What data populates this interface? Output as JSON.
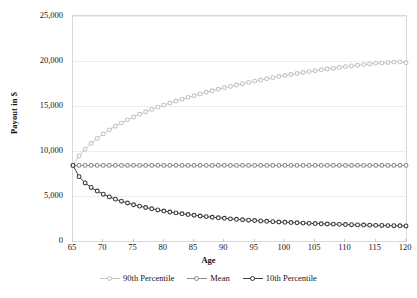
{
  "chart_data": {
    "type": "line",
    "title": "",
    "xlabel": "Age",
    "ylabel": "Payout in $",
    "xlim": [
      65,
      120
    ],
    "ylim": [
      0,
      25000
    ],
    "grid": true,
    "legend_position": "bottom",
    "x_tick_labels": [
      "65",
      "70",
      "75",
      "80",
      "85",
      "90",
      "95",
      "100",
      "105",
      "110",
      "115",
      "120"
    ],
    "x_ticks": [
      65,
      70,
      75,
      80,
      85,
      90,
      95,
      100,
      105,
      110,
      115,
      120
    ],
    "y_tick_labels": [
      "0",
      "5,000",
      "10,000",
      "15,000",
      "20,000",
      "25,000"
    ],
    "y_ticks": [
      0,
      5000,
      10000,
      15000,
      20000,
      25000
    ],
    "x": [
      65,
      66,
      67,
      68,
      69,
      70,
      71,
      72,
      73,
      74,
      75,
      76,
      77,
      78,
      79,
      80,
      81,
      82,
      83,
      84,
      85,
      86,
      87,
      88,
      89,
      90,
      91,
      92,
      93,
      94,
      95,
      96,
      97,
      98,
      99,
      100,
      101,
      102,
      103,
      104,
      105,
      106,
      107,
      108,
      109,
      110,
      111,
      112,
      113,
      114,
      115,
      116,
      117,
      118,
      119,
      120
    ],
    "series": [
      {
        "name": "90th Percentile",
        "color": "#c4c4c4",
        "marker": "circle",
        "values": [
          8400,
          9450,
          10200,
          10850,
          11400,
          11900,
          12350,
          12750,
          13120,
          13460,
          13780,
          14080,
          14360,
          14620,
          14870,
          15100,
          15330,
          15550,
          15760,
          15960,
          16150,
          16340,
          16520,
          16690,
          16860,
          17020,
          17180,
          17330,
          17480,
          17620,
          17760,
          17890,
          18020,
          18150,
          18270,
          18390,
          18500,
          18610,
          18720,
          18820,
          18920,
          19020,
          19110,
          19200,
          19290,
          19370,
          19450,
          19530,
          19600,
          19670,
          19740,
          19790,
          19840,
          19880,
          19900,
          19800
        ]
      },
      {
        "name": "Mean",
        "color": "#8a8a8a",
        "marker": "circle",
        "values": [
          8400,
          8400,
          8400,
          8400,
          8400,
          8400,
          8400,
          8400,
          8400,
          8400,
          8400,
          8400,
          8400,
          8400,
          8400,
          8400,
          8400,
          8400,
          8400,
          8400,
          8400,
          8400,
          8400,
          8400,
          8400,
          8400,
          8400,
          8400,
          8400,
          8400,
          8400,
          8400,
          8400,
          8400,
          8400,
          8400,
          8400,
          8400,
          8400,
          8400,
          8400,
          8400,
          8400,
          8400,
          8400,
          8400,
          8400,
          8400,
          8400,
          8400,
          8400,
          8400,
          8400,
          8400,
          8400,
          8400
        ]
      },
      {
        "name": "10th Percentile",
        "color": "#3c3c3c",
        "marker": "circle",
        "values": [
          8400,
          7150,
          6450,
          5950,
          5550,
          5200,
          4900,
          4650,
          4420,
          4220,
          4030,
          3870,
          3720,
          3580,
          3450,
          3330,
          3220,
          3120,
          3020,
          2940,
          2860,
          2780,
          2710,
          2640,
          2580,
          2520,
          2460,
          2410,
          2360,
          2310,
          2270,
          2230,
          2190,
          2150,
          2110,
          2080,
          2050,
          2020,
          1990,
          1960,
          1940,
          1910,
          1890,
          1870,
          1850,
          1830,
          1810,
          1790,
          1770,
          1760,
          1740,
          1730,
          1710,
          1700,
          1690,
          1670
        ]
      }
    ]
  },
  "legend": {
    "entries": [
      {
        "label": "90th Percentile"
      },
      {
        "label": "Mean"
      },
      {
        "label": "10th Percentile"
      }
    ]
  }
}
